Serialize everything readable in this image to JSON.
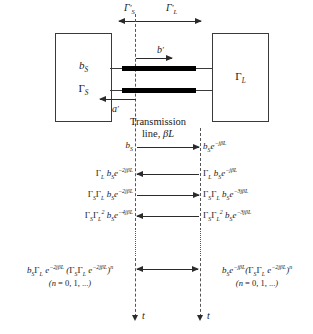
{
  "diagram": {
    "top_reflection_labels": {
      "source_side": "Γ′S",
      "load_side": "Γ′L"
    },
    "source_box": {
      "wave_label": "bS",
      "reflection_label": "ΓS"
    },
    "load_box": {
      "reflection_label": "ΓL"
    },
    "inner_waves": {
      "forward": "b′",
      "backward": "a′"
    },
    "transmission_line_caption": {
      "line1": "Transmission",
      "line2": "line, βL"
    },
    "time_axis_label": "t",
    "ellipsis": "⋮",
    "bounce_rows": [
      {
        "direction": "right",
        "left_label": "bS",
        "right_label": "bS e−jβL"
      },
      {
        "direction": "left",
        "left_label": "ΓL bS e−2jβL",
        "right_label": "ΓL bS e−jβL"
      },
      {
        "direction": "right",
        "left_label": "ΓS ΓL bS e−2jβL",
        "right_label": "ΓS ΓL bS e−3jβL"
      },
      {
        "direction": "left",
        "left_label": "ΓS ΓL² bS e−4jβL",
        "right_label": "ΓS ΓL² bS e−3jβL"
      }
    ],
    "general_terms": {
      "left": {
        "expression": "bS ΓL e−2jβL (ΓS ΓL e−2jβL)ⁿ",
        "condition": "(n = 0, 1, ...)"
      },
      "right": {
        "expression": "bS e−jβL (ΓS ΓL e−2jβL)ⁿ",
        "condition": "(n = 0, 1, ...)"
      }
    },
    "colors": {
      "ink": "#1a1a1a",
      "conductor": "#000000",
      "plane": "#555555",
      "box_border": "#3a3a3a"
    }
  }
}
